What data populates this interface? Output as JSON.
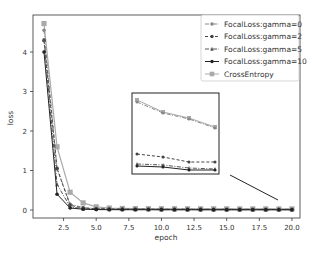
{
  "chart_data": {
    "type": "line",
    "title": "",
    "xlabel": "epoch",
    "ylabel": "loss",
    "xlim": [
      0.5,
      20.5
    ],
    "ylim": [
      -0.2,
      4.9
    ],
    "x_ticks": [
      "2.5",
      "5.0",
      "7.5",
      "10.0",
      "12.5",
      "15.0",
      "17.5",
      "20.0"
    ],
    "y_ticks": [
      "0",
      "1",
      "2",
      "3",
      "4"
    ],
    "grid": false,
    "legend_position": "upper right",
    "x": [
      1,
      2,
      3,
      4,
      5,
      6,
      7,
      8,
      9,
      10,
      11,
      12,
      13,
      14,
      15,
      16,
      17,
      18,
      19,
      20
    ],
    "series": [
      {
        "name": "FocalLoss:gamma=0",
        "style": "dashdot",
        "marker": "circle",
        "color": "#888888",
        "values": [
          4.55,
          1.05,
          0.15,
          0.06,
          0.04,
          0.035,
          0.03,
          0.03,
          0.028,
          0.027,
          0.026,
          0.025,
          0.025,
          0.024,
          0.024,
          0.023,
          0.023,
          0.022,
          0.022,
          0.022
        ]
      },
      {
        "name": "FocalLoss:gamma=2",
        "style": "dashed",
        "marker": "circle",
        "color": "#444444",
        "values": [
          4.3,
          1.05,
          0.12,
          0.05,
          0.03,
          0.025,
          0.022,
          0.02,
          0.018,
          0.017,
          0.016,
          0.015,
          0.015,
          0.014,
          0.014,
          0.013,
          0.013,
          0.013,
          0.012,
          0.012
        ]
      },
      {
        "name": "FocalLoss:gamma=5",
        "style": "dashdot",
        "marker": "triangle",
        "color": "#555555",
        "values": [
          4.3,
          0.65,
          0.08,
          0.03,
          0.02,
          0.015,
          0.013,
          0.012,
          0.011,
          0.01,
          0.01,
          0.009,
          0.009,
          0.009,
          0.008,
          0.008,
          0.008,
          0.008,
          0.008,
          0.008
        ]
      },
      {
        "name": "FocalLoss:gamma=10",
        "style": "solid",
        "marker": "circle",
        "color": "#222222",
        "values": [
          4.0,
          0.4,
          0.05,
          0.02,
          0.01,
          0.008,
          0.007,
          0.006,
          0.006,
          0.005,
          0.005,
          0.005,
          0.005,
          0.004,
          0.004,
          0.004,
          0.004,
          0.004,
          0.004,
          0.004
        ]
      },
      {
        "name": "CrossEntropy",
        "style": "solid",
        "marker": "square",
        "color": "#aaaaaa",
        "values": [
          4.72,
          1.6,
          0.45,
          0.18,
          0.08,
          0.05,
          0.04,
          0.035,
          0.033,
          0.032,
          0.031,
          0.03,
          0.03,
          0.029,
          0.029,
          0.028,
          0.028,
          0.028,
          0.027,
          0.027
        ]
      }
    ],
    "annotations": [
      {
        "type": "inset_zoom",
        "description": "zoomed inset box showing late-epoch curves"
      },
      {
        "type": "line",
        "description": "connector line from inset to region near epoch 20"
      }
    ]
  },
  "legend": {
    "items": [
      "FocalLoss:gamma=0",
      "FocalLoss:gamma=2",
      "FocalLoss:gamma=5",
      "FocalLoss:gamma=10",
      "CrossEntropy"
    ]
  },
  "axes": {
    "xlabel": "epoch",
    "ylabel": "loss"
  }
}
